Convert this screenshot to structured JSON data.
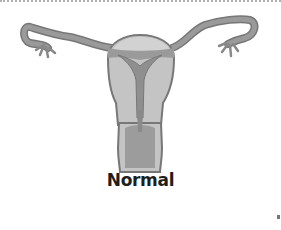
{
  "figure": {
    "label": "Normal",
    "colors": {
      "outline": "#777777",
      "tube_fill": "#9a9a9a",
      "myometrium_fill": "#c4c4c4",
      "cavity_fill": "#8f8f8f",
      "fundus_fill": "#c9c9c9",
      "background": "#ffffff"
    }
  }
}
